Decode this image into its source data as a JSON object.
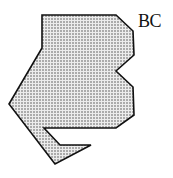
{
  "diagram": {
    "label": "BC",
    "shape": {
      "name": "stippled-polygon",
      "fill_pattern": "dots",
      "fill_background": "#e8e8e8",
      "dot_color": "#555555",
      "stroke_color": "#111111",
      "points": "42,15 116,15 133,31 134,55 116,71 133,87 134,115 116,128 44,128 60,145 91,145 55,164 9,104 42,48"
    }
  }
}
